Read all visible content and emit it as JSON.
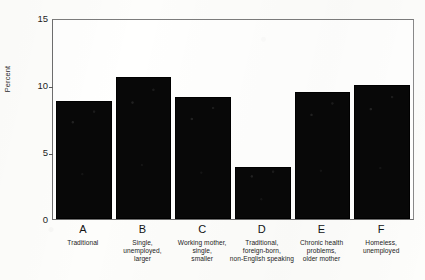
{
  "chart_data": {
    "type": "bar",
    "title": "",
    "xlabel": "",
    "ylabel": "Percent",
    "ylim": [
      0,
      15
    ],
    "yticks": [
      0,
      5,
      10,
      15
    ],
    "grid": false,
    "legend": null,
    "categories": [
      "A",
      "B",
      "C",
      "D",
      "E",
      "F"
    ],
    "category_descriptions": [
      [
        "Traditional"
      ],
      [
        "Single,",
        "unemployed,",
        "larger"
      ],
      [
        "Working mother,",
        "single,",
        "smaller"
      ],
      [
        "Traditional,",
        "foreign-born,",
        "non-English speaking"
      ],
      [
        "Chronic health",
        "problems,",
        "older mother"
      ],
      [
        "Homeless,",
        "unemployed"
      ]
    ],
    "values": [
      8.8,
      10.6,
      9.1,
      3.9,
      9.5,
      10.0
    ],
    "bar_color": "#080808",
    "frame_color": "#6e6e6e",
    "background_color": "#fdfdfb"
  }
}
